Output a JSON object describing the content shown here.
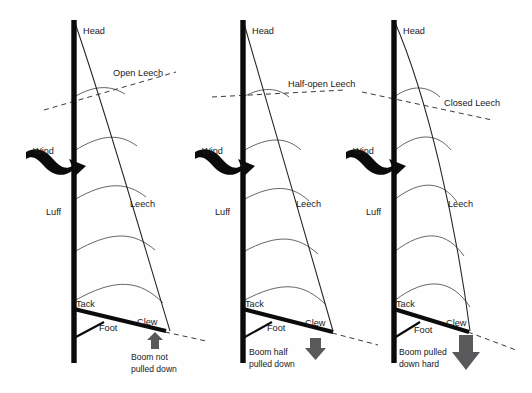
{
  "diagram": {
    "background_color": "#fefefe",
    "ink_color": "#0b0b0b",
    "arrow_gray": "#59595b",
    "panels": [
      {
        "id": "panel-open",
        "leech_state_label": "Open Leech",
        "wind_label": "Wind",
        "head_label": "Head",
        "luff_label": "Luff",
        "leech_label": "Leech",
        "tack_label": "Tack",
        "clew_label": "Clew",
        "foot_label": "Foot",
        "boom_caption_line1": "Boom not",
        "boom_caption_line2": "pulled down",
        "boom_arrow_direction": "up",
        "boom_arrow_size": "small"
      },
      {
        "id": "panel-half-open",
        "leech_state_label": "Half-open Leech",
        "wind_label": "Wind",
        "head_label": "Head",
        "luff_label": "Luff",
        "leech_label": "Leech",
        "tack_label": "Tack",
        "clew_label": "Clew",
        "foot_label": "Foot",
        "boom_caption_line1": "Boom half",
        "boom_caption_line2": "pulled down",
        "boom_arrow_direction": "down",
        "boom_arrow_size": "medium"
      },
      {
        "id": "panel-closed",
        "leech_state_label": "Closed Leech",
        "wind_label": "Wind",
        "head_label": "Head",
        "luff_label": "Luff",
        "leech_label": "Leech",
        "tack_label": "Tack",
        "clew_label": "Clew",
        "foot_label": "Foot",
        "boom_caption_line1": "Boom pulled",
        "boom_caption_line2": "down hard",
        "boom_arrow_direction": "down",
        "boom_arrow_size": "large"
      }
    ]
  }
}
